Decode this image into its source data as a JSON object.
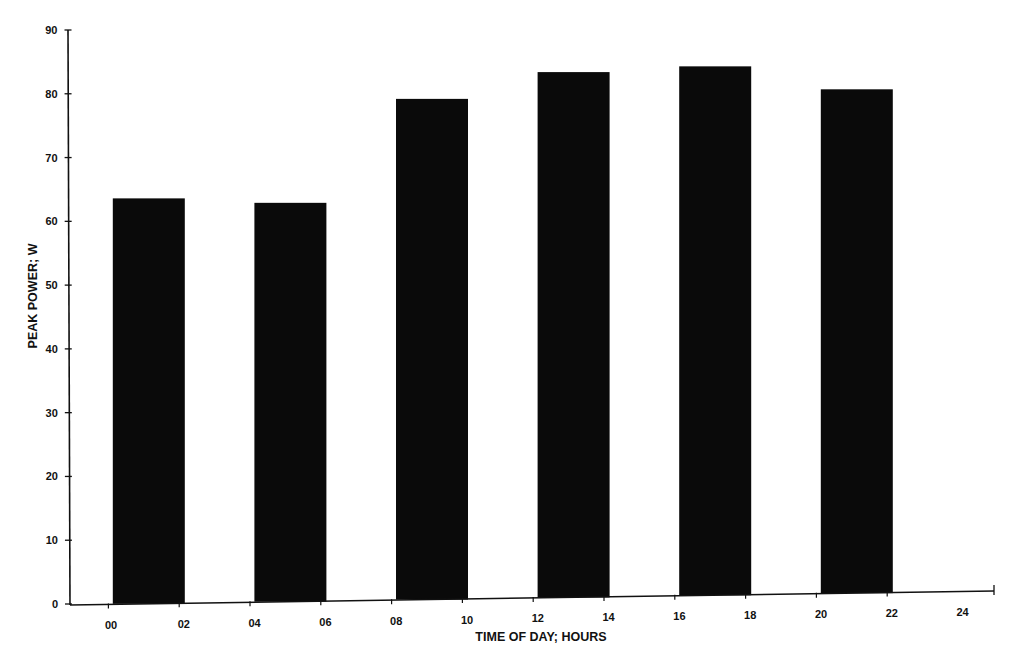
{
  "chart_data": {
    "type": "bar",
    "title": "",
    "xlabel": "TIME OF DAY; HOURS",
    "ylabel": "PEAK POWER; W",
    "ylim": [
      0,
      90
    ],
    "yticks": [
      "0",
      "10",
      "20",
      "30",
      "40",
      "50",
      "60",
      "70",
      "80",
      "90"
    ],
    "xticks": [
      "00",
      "02",
      "04",
      "06",
      "08",
      "10",
      "12",
      "14",
      "16",
      "18",
      "20",
      "22",
      "24"
    ],
    "categories": [
      "02",
      "06",
      "10",
      "14",
      "18",
      "22"
    ],
    "values": [
      63.6,
      62.9,
      79.2,
      83.4,
      84.3,
      80.7
    ],
    "bar_color": "#0a0a0a",
    "grid": false,
    "legend": null
  }
}
